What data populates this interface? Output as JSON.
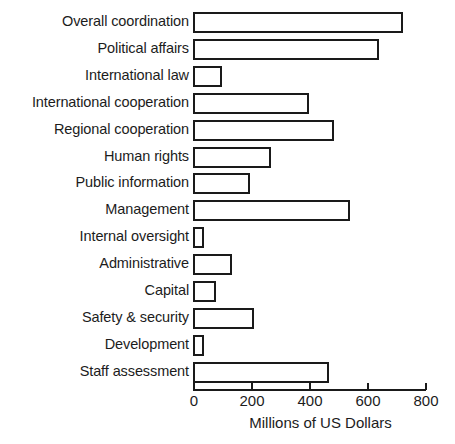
{
  "chart_data": {
    "type": "bar",
    "orientation": "horizontal",
    "title": "",
    "subtitle": "",
    "xlabel": "Millions of US Dollars",
    "ylabel": "",
    "xlim": [
      0,
      800
    ],
    "xticks": [
      0,
      200,
      400,
      600,
      800
    ],
    "xtick_labels": [
      "0",
      "200",
      "400",
      "600",
      "800"
    ],
    "grid": false,
    "legend": false,
    "bar_style": {
      "fill": "#ffffff",
      "edge": "#1a1a1a",
      "edge_width": 2
    },
    "categories": [
      "Overall coordination",
      "Political affairs",
      "International law",
      "International cooperation",
      "Regional cooperation",
      "Human rights",
      "Public information",
      "Management",
      "Internal oversight",
      "Administrative",
      "Capital",
      "Safety & security",
      "Development",
      "Staff assessment"
    ],
    "values": [
      725,
      640,
      100,
      400,
      485,
      268,
      196,
      540,
      38,
      133,
      78,
      212,
      38,
      468
    ]
  }
}
